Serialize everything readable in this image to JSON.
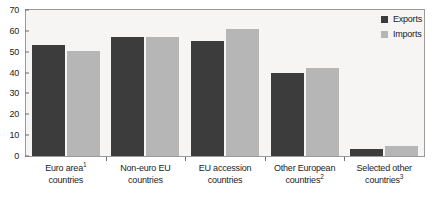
{
  "chart_data": {
    "type": "bar",
    "title": "",
    "xlabel": "",
    "ylabel": "",
    "ylim": [
      0,
      70
    ],
    "yticks": [
      0,
      10,
      20,
      30,
      40,
      50,
      60,
      70
    ],
    "grid": false,
    "legend_position": "top-right",
    "categories": [
      "Euro area¹ countries",
      "Non-euro EU countries",
      "EU accession countries",
      "Other European countries²",
      "Selected other countries³"
    ],
    "category_lines": [
      [
        "Euro area",
        "1",
        "countries"
      ],
      [
        "Non-euro EU",
        "",
        "countries"
      ],
      [
        "EU accession",
        "",
        "countries"
      ],
      [
        "Other European",
        "",
        "countries",
        "2"
      ],
      [
        "Selected other",
        "",
        "countries",
        "3"
      ]
    ],
    "series": [
      {
        "name": "Exports",
        "color": "#3c3c3c",
        "values": [
          53,
          57,
          55,
          40,
          3.5
        ]
      },
      {
        "name": "Imports",
        "color": "#b6b6b6",
        "values": [
          50.5,
          57,
          61,
          42,
          5
        ]
      }
    ]
  },
  "axis": {
    "tick_labels": [
      "70",
      "60",
      "50",
      "40",
      "30",
      "20",
      "10",
      "0"
    ]
  },
  "legend": {
    "entries": [
      {
        "label": "Exports"
      },
      {
        "label": "Imports"
      }
    ]
  },
  "xlabels": [
    {
      "line1": "Euro area",
      "sup1": "1",
      "line2": "countries",
      "sup2": ""
    },
    {
      "line1": "Non-euro EU",
      "sup1": "",
      "line2": "countries",
      "sup2": ""
    },
    {
      "line1": "EU accession",
      "sup1": "",
      "line2": "countries",
      "sup2": ""
    },
    {
      "line1": "Other European",
      "sup1": "",
      "line2": "countries",
      "sup2": "2"
    },
    {
      "line1": "Selected other",
      "sup1": "",
      "line2": "countries",
      "sup2": "3"
    }
  ],
  "colors": {
    "exports": "#3c3c3c",
    "imports": "#b6b6b6",
    "plot_background": "#f6f5f3",
    "axis": "#9a9a9a",
    "text": "#1c1c1c"
  }
}
